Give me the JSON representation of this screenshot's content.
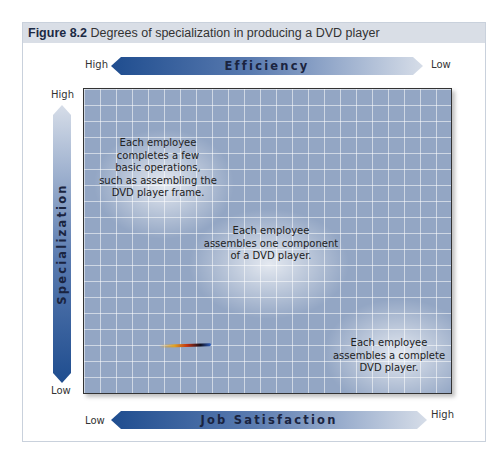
{
  "figure": {
    "caption_label": "Figure 8.2",
    "caption_text": " Degrees of specialization in producing a DVD player"
  },
  "axes": {
    "efficiency": {
      "label": "Efficiency",
      "left": "High",
      "right": "Low"
    },
    "job_satisfaction": {
      "label": "Job Satisfaction",
      "left": "Low",
      "right": "High"
    },
    "specialization": {
      "label": "Specialization",
      "top": "High",
      "bottom": "Low"
    }
  },
  "notes": [
    {
      "text_lines": [
        "Each employee",
        "completes a few",
        "basic operations,",
        "such as assembling the",
        "DVD player frame."
      ]
    },
    {
      "text_lines": [
        "Each employee",
        "assembles one component",
        "of a DVD player."
      ]
    },
    {
      "text_lines": [
        "Each employee",
        "assembles a complete",
        "DVD player."
      ]
    }
  ],
  "colors": {
    "arrow_dark": "#1f4d8f",
    "arrow_light": "#d6dde8",
    "grid_bg": "#93a6c4",
    "caption_bg": "#d9dee6"
  }
}
